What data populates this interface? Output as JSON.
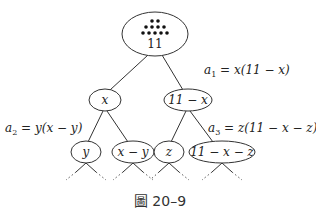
{
  "diagram": {
    "root": {
      "label": "11",
      "dots_rows": [
        2,
        4,
        5
      ],
      "dot_count": 11
    },
    "level1": [
      {
        "label": "x"
      },
      {
        "label": "11 − x"
      }
    ],
    "level2": [
      {
        "label": "y"
      },
      {
        "label": "x − y"
      },
      {
        "label": "z"
      },
      {
        "label": "11 − x − z"
      }
    ],
    "annotations": {
      "a1": {
        "lhs": "a",
        "sub": "1",
        "rhs": " = x(11 − x)"
      },
      "a2": {
        "lhs": "a",
        "sub": "2",
        "rhs": " = y(x − y)"
      },
      "a3": {
        "lhs": "a",
        "sub": "3",
        "rhs": " = z(11 − x − z)"
      }
    },
    "caption": "圖 20–9"
  }
}
